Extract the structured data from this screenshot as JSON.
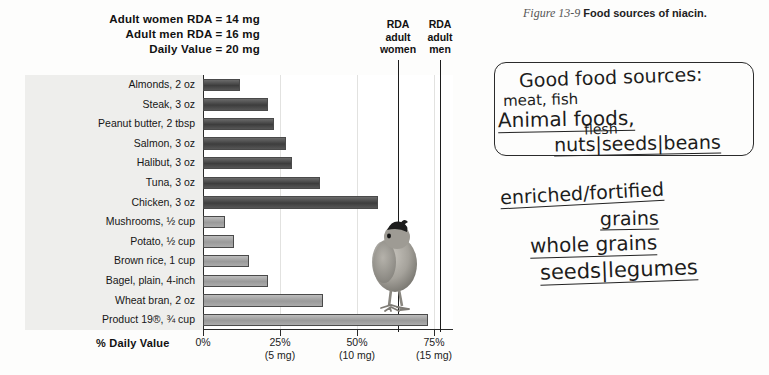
{
  "figure": {
    "number": "Figure 13-9",
    "caption": "Food sources of niacin."
  },
  "header": {
    "line1": "Adult women RDA = 14 mg",
    "line2": "Adult men RDA = 16 mg",
    "line3": "Daily Value = 20 mg"
  },
  "reference_lines": [
    {
      "name": "rda-adult-women",
      "label_line1": "RDA",
      "label_line2": "adult",
      "label_line3": "women",
      "percent": 70
    },
    {
      "name": "rda-adult-men",
      "label_line1": "RDA",
      "label_line2": "adult",
      "label_line3": "men",
      "percent": 80
    }
  ],
  "axis": {
    "title": "% Daily Value",
    "ticks": [
      {
        "percent": "0%",
        "mg": ""
      },
      {
        "percent": "25%",
        "mg": "(5 mg)"
      },
      {
        "percent": "50%",
        "mg": "(10 mg)"
      },
      {
        "percent": "75%",
        "mg": "(15 mg)"
      }
    ]
  },
  "chart_data": {
    "type": "bar",
    "title": "Food sources of niacin.",
    "xlabel": "% Daily Value",
    "ylabel": "",
    "xlim": [
      0,
      80
    ],
    "grid": true,
    "orientation": "horizontal",
    "categories": [
      "Almonds, 2 oz",
      "Steak, 3 oz",
      "Peanut butter, 2 tbsp",
      "Salmon, 3 oz",
      "Halibut, 3 oz",
      "Tuna, 3 oz",
      "Chicken, 3 oz",
      "Mushrooms, ½ cup",
      "Potato, ½ cup",
      "Brown rice, 1 cup",
      "Bagel, plain, 4-inch",
      "Wheat bran, 2 oz",
      "Product 19®, ¾ cup"
    ],
    "values": [
      12,
      21,
      23,
      27,
      29,
      38,
      57,
      7,
      10,
      15,
      21,
      39,
      73
    ],
    "groups": [
      "animal",
      "animal",
      "animal",
      "animal",
      "animal",
      "animal",
      "animal",
      "plant",
      "plant",
      "plant",
      "plant",
      "plant",
      "plant"
    ],
    "annotations": [
      "Adult women RDA = 14 mg",
      "Adult men RDA = 16 mg",
      "Daily Value = 20 mg"
    ]
  },
  "handwriting": {
    "boxed": {
      "title": "Good food sources:",
      "line_meat": "meat, fish",
      "line_animal": "Animal foods,",
      "line_flesh": "flesh",
      "line_nuts": "nuts|seeds|beans"
    },
    "below": {
      "line1": "enriched/fortified",
      "line2": "grains",
      "line3": "whole grains",
      "line4": "seeds|legumes"
    }
  }
}
